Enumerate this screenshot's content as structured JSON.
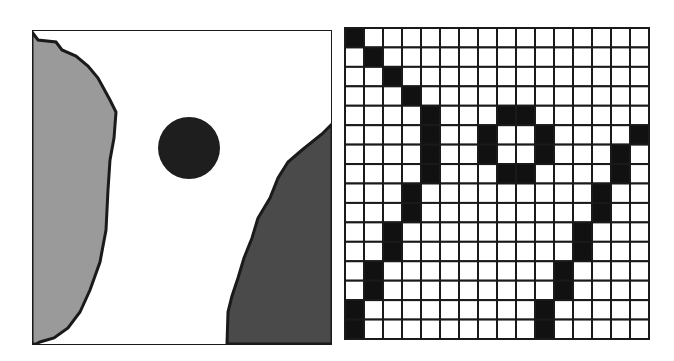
{
  "left_panel": {
    "description": "Continuous region map",
    "colors": {
      "background": "#ffffff",
      "left_region": "#9a9a9a",
      "right_region": "#4a4a4a",
      "circle": "#1e1e1e",
      "outline": "#1a1a1a"
    }
  },
  "grid_panel": {
    "description": "Rasterized occupancy grid",
    "rows": 16,
    "cols": 16,
    "filled_color": "#111111",
    "empty_color": "#ffffff",
    "line_color": "#1a1a1a",
    "filled_cells": [
      [
        0,
        0
      ],
      [
        1,
        1
      ],
      [
        2,
        2
      ],
      [
        3,
        3
      ],
      [
        4,
        4
      ],
      [
        5,
        4
      ],
      [
        6,
        4
      ],
      [
        7,
        4
      ],
      [
        8,
        3
      ],
      [
        9,
        3
      ],
      [
        10,
        2
      ],
      [
        11,
        2
      ],
      [
        12,
        1
      ],
      [
        13,
        1
      ],
      [
        14,
        0
      ],
      [
        15,
        0
      ],
      [
        4,
        8
      ],
      [
        4,
        9
      ],
      [
        5,
        7
      ],
      [
        6,
        7
      ],
      [
        5,
        10
      ],
      [
        6,
        10
      ],
      [
        7,
        8
      ],
      [
        7,
        9
      ],
      [
        5,
        15
      ],
      [
        6,
        14
      ],
      [
        7,
        14
      ],
      [
        8,
        13
      ],
      [
        9,
        13
      ],
      [
        10,
        12
      ],
      [
        11,
        12
      ],
      [
        12,
        11
      ],
      [
        13,
        11
      ],
      [
        14,
        10
      ],
      [
        15,
        10
      ]
    ]
  }
}
